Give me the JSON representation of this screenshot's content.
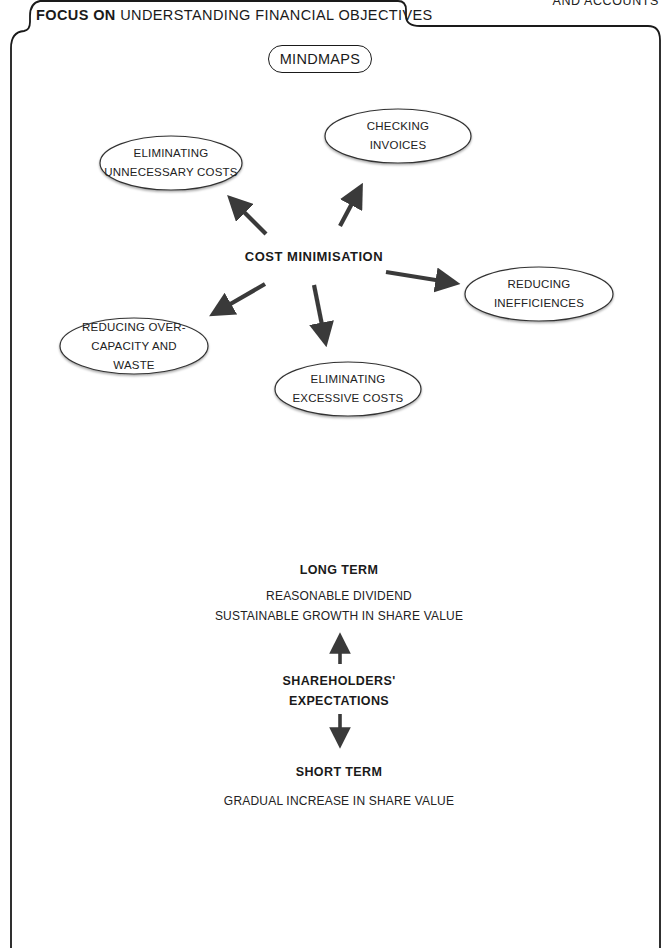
{
  "header": {
    "tab_bold": "FOCUS ON",
    "tab_rest": " UNDERSTANDING FINANCIAL OBJECTIVES",
    "corner_text": "AND ACCOUNTS"
  },
  "section_label": "MINDMAPS",
  "mindmap_cost": {
    "center": "COST MINIMISATION",
    "nodes": [
      {
        "lines": [
          "ELIMINATING",
          "UNNECESSARY COSTS"
        ]
      },
      {
        "lines": [
          "CHECKING",
          "INVOICES"
        ]
      },
      {
        "lines": [
          "REDUCING",
          "INEFFICIENCES"
        ]
      },
      {
        "lines": [
          "REDUCING OVER-",
          "CAPACITY AND",
          "WASTE"
        ]
      },
      {
        "lines": [
          "ELIMINATING",
          "EXCESSIVE COSTS"
        ]
      }
    ]
  },
  "mindmap_shareholders": {
    "center_line1": "SHAREHOLDERS'",
    "center_line2": "EXPECTATIONS",
    "long_term": {
      "heading": "LONG TERM",
      "items": [
        "REASONABLE DIVIDEND",
        "SUSTAINABLE GROWTH IN SHARE VALUE"
      ]
    },
    "short_term": {
      "heading": "SHORT TERM",
      "items": [
        "GRADUAL INCREASE IN SHARE VALUE"
      ]
    }
  },
  "colors": {
    "line": "#1a1a1a",
    "arrow": "#3a3a3a",
    "text": "#222222"
  }
}
